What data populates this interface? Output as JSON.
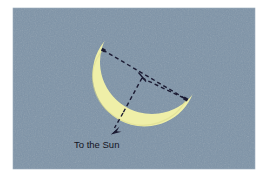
{
  "figure": {
    "background_color": "#ffffff",
    "panel_color": "#7e94a8",
    "panel": {
      "x": 13,
      "y": 8,
      "width": 242,
      "height": 161
    },
    "moon": {
      "name": "crescent-moon",
      "fill_color": "#efefa8",
      "outline_color": "#d8d88c",
      "tip_upper": [
        103,
        50
      ],
      "tip_lower": [
        186,
        100
      ],
      "terminator_point": [
        123,
        113
      ]
    },
    "construction_lines": {
      "color": "#1b1b33",
      "style": "dashed",
      "dash_pattern": "4 3",
      "width": 1.4,
      "segments": [
        {
          "name": "upper-chord",
          "from": [
            103,
            50
          ],
          "to": [
            186,
            99
          ]
        },
        {
          "name": "radius-to-terminator",
          "from": [
            142,
            78
          ],
          "to": [
            123,
            113
          ]
        },
        {
          "name": "radius-to-lower-tip",
          "from": [
            142,
            78
          ],
          "to": [
            186,
            99
          ]
        },
        {
          "name": "arrow-stem",
          "from": [
            123,
            113
          ],
          "to": [
            113,
            131
          ]
        }
      ],
      "right_angle_tick": {
        "at": [
          142,
          78
        ]
      }
    },
    "arrow": {
      "name": "sun-direction-arrow",
      "color": "#1b1b33",
      "tip": [
        111,
        134
      ],
      "direction": "down-left"
    },
    "label": {
      "text": "To the Sun",
      "color": "#14141e",
      "x": 74,
      "y": 148,
      "font_size": 9.5
    }
  }
}
